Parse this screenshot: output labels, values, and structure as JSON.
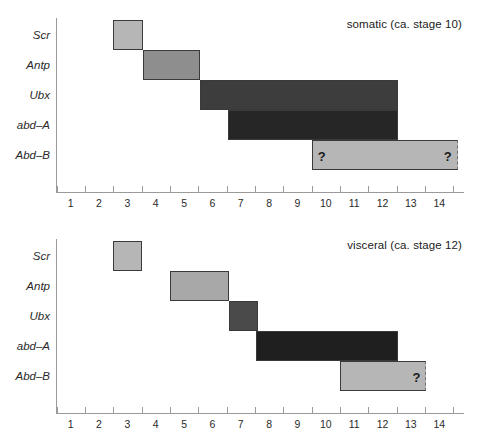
{
  "figure": {
    "name": "hox-expression-domains",
    "x_axis": {
      "ticks": [
        "1",
        "2",
        "3",
        "4",
        "5",
        "6",
        "7",
        "8",
        "9",
        "10",
        "11",
        "12",
        "13",
        "14"
      ],
      "min": 0,
      "max": 14.4
    },
    "row_labels": [
      "Scr",
      "Antp",
      "Ubx",
      "abd-A",
      "Abd-B"
    ],
    "colors": {
      "light_gray": "#b6b6b6",
      "mid_gray": "#8e8e8e",
      "dark_gray": "#3d3d3d",
      "darkest_gray": "#262626",
      "axis": "#9a9a9a",
      "text": "#1c1c1c"
    }
  },
  "chart_data": {
    "type": "bar",
    "xlabel": "",
    "ylabel": "",
    "xlim": [
      0,
      14.4
    ],
    "grid": false,
    "legend": "none",
    "orientation": "horizontal-ranges",
    "x_tick_labels": [
      "1",
      "2",
      "3",
      "4",
      "5",
      "6",
      "7",
      "8",
      "9",
      "10",
      "11",
      "12",
      "13",
      "14"
    ],
    "categories": [
      "Scr",
      "Antp",
      "Ubx",
      "abd-A",
      "Abd-B"
    ],
    "panels": [
      {
        "id": "somatic",
        "title": "somatic (ca. stage 10)",
        "bars": [
          {
            "gene": "Scr",
            "start": 2.0,
            "end": 3.05,
            "color": "#b6b6b6",
            "border": "solid",
            "labels": []
          },
          {
            "gene": "Antp",
            "start": 3.05,
            "end": 5.05,
            "color": "#8e8e8e",
            "border": "solid",
            "labels": []
          },
          {
            "gene": "Ubx",
            "start": 5.05,
            "end": 12.05,
            "color": "#3d3d3d",
            "border": "solid",
            "labels": []
          },
          {
            "gene": "abd-A",
            "start": 6.05,
            "end": 12.05,
            "color": "#262626",
            "border": "solid",
            "labels": []
          },
          {
            "gene": "Abd-B",
            "start": 9.0,
            "end": 14.15,
            "color": "#b6b6b6",
            "border": "dashed-right",
            "labels": [
              "?",
              "?"
            ]
          }
        ]
      },
      {
        "id": "visceral",
        "title": "visceral (ca. stage 12)",
        "bars": [
          {
            "gene": "Scr",
            "start": 2.0,
            "end": 3.0,
            "color": "#b6b6b6",
            "border": "solid",
            "labels": []
          },
          {
            "gene": "Antp",
            "start": 4.0,
            "end": 6.1,
            "color": "#a8a8a8",
            "border": "solid",
            "labels": []
          },
          {
            "gene": "Ubx",
            "start": 6.1,
            "end": 7.1,
            "color": "#4a4a4a",
            "border": "solid",
            "labels": []
          },
          {
            "gene": "abd-A",
            "start": 7.05,
            "end": 12.05,
            "color": "#1f1f1f",
            "border": "solid",
            "labels": []
          },
          {
            "gene": "Abd-B",
            "start": 10.0,
            "end": 13.05,
            "color": "#b6b6b6",
            "border": "dashed-right",
            "labels": [
              "?"
            ]
          }
        ]
      }
    ]
  }
}
